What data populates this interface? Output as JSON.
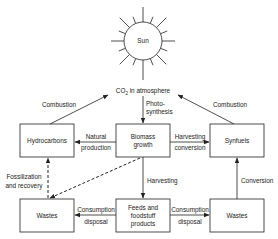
{
  "diagram": {
    "sun": {
      "label": "Sun"
    },
    "atmosphere": {
      "label_main": "CO",
      "label_sub": "2",
      "label_rest": " in atmosphere"
    },
    "nodes": {
      "hydrocarbons": "Hydrocarbons",
      "biomass_line1": "Biomass",
      "biomass_line2": "growth",
      "synfuels": "Synfuels",
      "wastes_left": "Wastes",
      "feeds_line1": "Feeds and",
      "feeds_line2": "foodstuff",
      "feeds_line3": "products",
      "wastes_right": "Wastes"
    },
    "edges": {
      "combustion_left": "Combustion",
      "combustion_right": "Combustion",
      "photosynthesis_line1": "Photo-",
      "photosynthesis_line2": "synthesis",
      "natural_line1": "Natural",
      "natural_line2": "production",
      "harvesting_conv_line1": "Harvesting",
      "harvesting_conv_line2": "conversion",
      "fossil_line1": "Fossilization",
      "fossil_line2": "and recovery",
      "harvesting": "Harvesting",
      "consumption_left_line1": "Consumption",
      "consumption_left_line2": "disposal",
      "consumption_right_line1": "Consumption",
      "consumption_right_line2": "disposal",
      "conversion": "Conversion"
    }
  }
}
